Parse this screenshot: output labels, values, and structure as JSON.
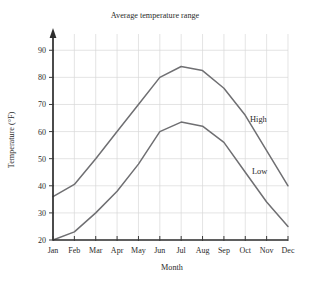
{
  "chart_data": {
    "type": "line",
    "title": "Average temperature range",
    "xlabel": "Month",
    "ylabel": "Temperature (°F)",
    "categories": [
      "Jan",
      "Feb",
      "Mar",
      "Apr",
      "May",
      "Jun",
      "Jul",
      "Aug",
      "Sep",
      "Oct",
      "Nov",
      "Dec"
    ],
    "ytick_labels": [
      "20",
      "30",
      "40",
      "50",
      "60",
      "70",
      "80",
      "90"
    ],
    "ytick_values": [
      20,
      30,
      40,
      50,
      60,
      70,
      80,
      90
    ],
    "ylim": [
      20,
      96
    ],
    "grid": true,
    "legend_position": "inline-right",
    "series": [
      {
        "name": "High",
        "label": "High",
        "color": "#6f6f72",
        "values": [
          36,
          40.5,
          50,
          60,
          70,
          80,
          84,
          82.5,
          76,
          66,
          53,
          40
        ]
      },
      {
        "name": "Low",
        "label": "Low",
        "color": "#6f6f72",
        "values": [
          20,
          23,
          30,
          38,
          48,
          60,
          63.5,
          62,
          56,
          45,
          34,
          25
        ]
      }
    ],
    "annotations": [
      {
        "text": "High",
        "series": "High"
      },
      {
        "text": "Low",
        "series": "Low"
      }
    ]
  }
}
